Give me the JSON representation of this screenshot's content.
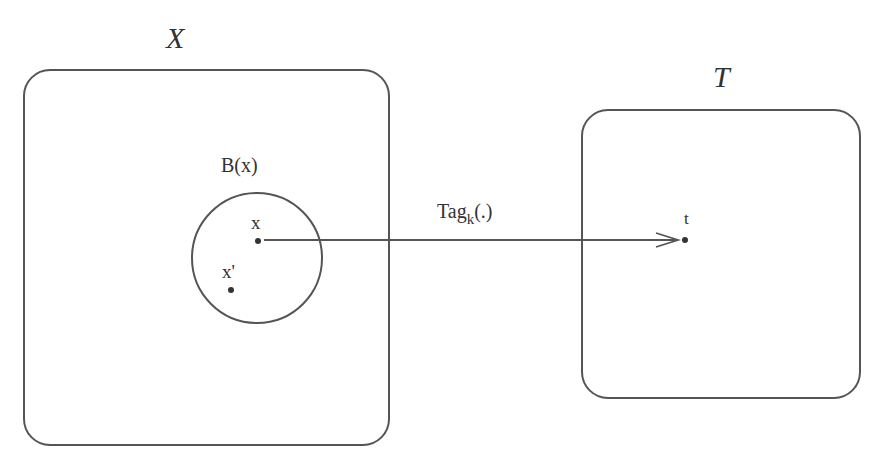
{
  "diagram": {
    "set_x": {
      "label": "X",
      "box": {
        "x": 24,
        "y": 70,
        "w": 365,
        "h": 375,
        "r": 26
      }
    },
    "set_t": {
      "label": "T",
      "box": {
        "x": 582,
        "y": 110,
        "w": 278,
        "h": 288,
        "r": 26
      }
    },
    "ball": {
      "label": "B(x)",
      "cx": 257,
      "cy": 258,
      "r": 65
    },
    "points": [
      {
        "label": "x",
        "px": 258,
        "py": 241
      },
      {
        "label": "x'",
        "px": 231,
        "py": 290
      },
      {
        "label": "t",
        "px": 685,
        "py": 240
      }
    ],
    "arrow": {
      "label_main": "Tag",
      "label_sub": "k",
      "label_suffix": "(.)",
      "from": [
        264,
        240
      ],
      "to": [
        678,
        240
      ]
    },
    "colors": {
      "stroke": "#555555",
      "text": "#333333",
      "background": "#ffffff"
    }
  }
}
